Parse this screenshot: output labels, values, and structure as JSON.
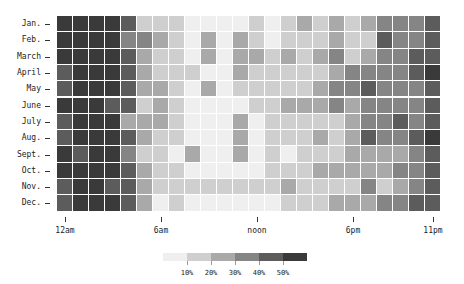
{
  "chart_data": {
    "type": "heatmap",
    "title": "",
    "xlabel": "",
    "ylabel": "",
    "rows": [
      "Jan.",
      "Feb.",
      "March",
      "April",
      "May",
      "June",
      "July",
      "Aug.",
      "Sept.",
      "Oct.",
      "Nov.",
      "Dec."
    ],
    "columns": [
      "12am",
      "1am",
      "2am",
      "3am",
      "4am",
      "5am",
      "6am",
      "7am",
      "8am",
      "9am",
      "10am",
      "11am",
      "noon",
      "1pm",
      "2pm",
      "3pm",
      "4pm",
      "5pm",
      "6pm",
      "7pm",
      "8pm",
      "9pm",
      "10pm",
      "11pm"
    ],
    "x_tick_labels": [
      {
        "label": "12am",
        "col": 0
      },
      {
        "label": "6am",
        "col": 6
      },
      {
        "label": "noon",
        "col": 12
      },
      {
        "label": "6pm",
        "col": 18
      },
      {
        "label": "11pm",
        "col": 23
      }
    ],
    "value_unit": "percent (binned level 0-5: <10%, 10-20%, 20-30%, 30-40%, 40-50%, >50%)",
    "levels": [
      [
        5,
        5,
        5,
        5,
        4,
        1,
        1,
        1,
        0,
        0,
        0,
        0,
        1,
        0,
        1,
        2,
        1,
        2,
        1,
        2,
        3,
        3,
        3,
        4
      ],
      [
        5,
        5,
        5,
        5,
        3,
        3,
        2,
        1,
        0,
        2,
        0,
        2,
        1,
        0,
        1,
        1,
        1,
        2,
        1,
        1,
        4,
        3,
        3,
        4
      ],
      [
        5,
        5,
        5,
        5,
        4,
        2,
        1,
        1,
        0,
        2,
        0,
        2,
        2,
        1,
        2,
        1,
        2,
        3,
        1,
        2,
        3,
        3,
        4,
        4
      ],
      [
        4,
        5,
        5,
        5,
        4,
        2,
        1,
        1,
        1,
        0,
        0,
        2,
        1,
        1,
        1,
        1,
        1,
        2,
        3,
        3,
        3,
        3,
        4,
        5
      ],
      [
        4,
        5,
        5,
        5,
        4,
        2,
        2,
        1,
        0,
        2,
        0,
        1,
        1,
        1,
        1,
        1,
        2,
        3,
        3,
        4,
        3,
        3,
        3,
        4
      ],
      [
        5,
        5,
        5,
        4,
        4,
        1,
        2,
        1,
        0,
        0,
        0,
        0,
        1,
        1,
        2,
        2,
        2,
        3,
        2,
        3,
        3,
        3,
        3,
        4
      ],
      [
        4,
        5,
        5,
        5,
        2,
        2,
        2,
        1,
        0,
        0,
        0,
        2,
        0,
        1,
        1,
        1,
        1,
        1,
        2,
        3,
        3,
        4,
        3,
        4
      ],
      [
        4,
        5,
        5,
        5,
        4,
        2,
        1,
        1,
        0,
        0,
        0,
        2,
        0,
        1,
        1,
        1,
        2,
        1,
        2,
        4,
        3,
        3,
        4,
        5
      ],
      [
        5,
        4,
        5,
        5,
        3,
        1,
        1,
        0,
        2,
        0,
        0,
        2,
        0,
        1,
        0,
        1,
        1,
        1,
        2,
        2,
        2,
        2,
        3,
        4
      ],
      [
        5,
        5,
        5,
        5,
        4,
        2,
        1,
        1,
        0,
        0,
        0,
        0,
        0,
        1,
        1,
        1,
        2,
        2,
        2,
        2,
        2,
        3,
        3,
        4
      ],
      [
        4,
        5,
        5,
        4,
        4,
        2,
        1,
        1,
        1,
        1,
        1,
        1,
        1,
        1,
        2,
        1,
        1,
        1,
        1,
        3,
        1,
        2,
        3,
        4
      ],
      [
        4,
        5,
        5,
        5,
        4,
        2,
        0,
        1,
        0,
        0,
        0,
        0,
        0,
        0,
        1,
        1,
        1,
        2,
        2,
        2,
        3,
        3,
        4,
        4
      ]
    ],
    "legend": {
      "position": "bottom-center",
      "tick_labels": [
        "10%",
        "20%",
        "30%",
        "40%",
        "50%"
      ],
      "colors": [
        "#efefef",
        "#cfcfcf",
        "#a9a9a9",
        "#858585",
        "#5c5c5c",
        "#3a3a3a"
      ]
    },
    "grid": false
  }
}
